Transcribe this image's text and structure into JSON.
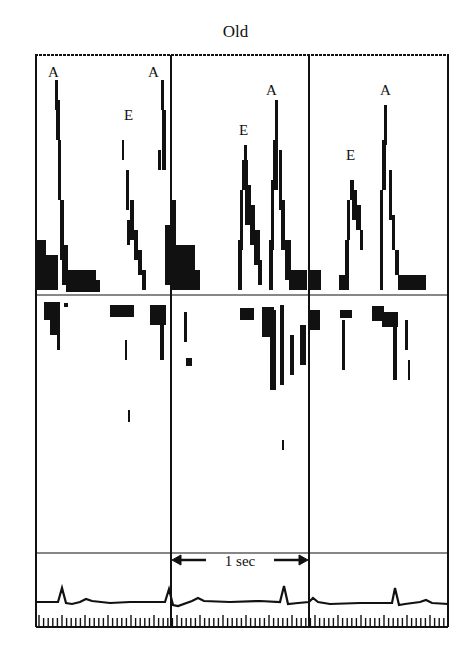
{
  "figure": {
    "title": "Old",
    "time_scale_label": "1 sec",
    "wave_labels": [
      {
        "text": "A",
        "x": 48,
        "y": 77
      },
      {
        "text": "A",
        "x": 148,
        "y": 77
      },
      {
        "text": "E",
        "x": 124,
        "y": 120
      },
      {
        "text": "A",
        "x": 272,
        "y": 95
      },
      {
        "text": "E",
        "x": 245,
        "y": 135
      },
      {
        "text": "A",
        "x": 387,
        "y": 95
      },
      {
        "text": "E",
        "x": 350,
        "y": 160
      }
    ],
    "panels": {
      "doppler": {
        "left": 36,
        "right": 448,
        "top": 55,
        "baseline": 295,
        "bottom": 553
      },
      "ecg": {
        "top": 553,
        "baseline": 602,
        "tick_top": 616,
        "bottom": 627
      },
      "beat_dividers_x": [
        171,
        309
      ]
    },
    "colors": {
      "ink": "#111111",
      "background": "#ffffff"
    }
  }
}
